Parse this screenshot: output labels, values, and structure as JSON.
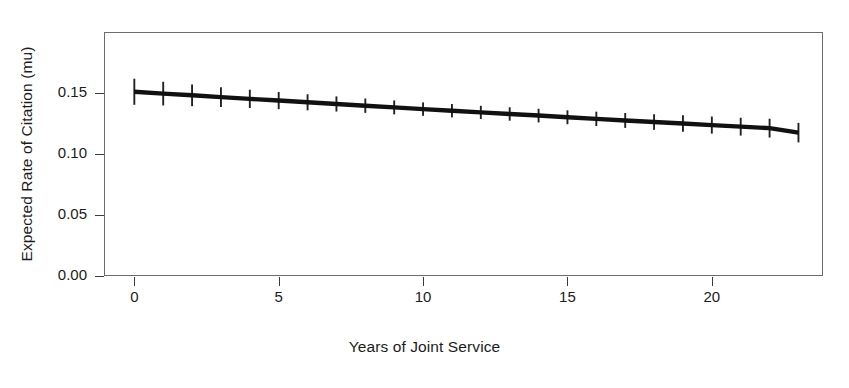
{
  "chart_data": {
    "type": "line",
    "title": "",
    "xlabel": "Years of Joint Service",
    "ylabel": "Expected Rate of Citation (mu)",
    "xlim": [
      -1.05,
      23.85
    ],
    "ylim": [
      0.0,
      0.2
    ],
    "grid": false,
    "legend": "none",
    "xticks": [
      0,
      5,
      10,
      15,
      20
    ],
    "xtick_labels": [
      "0",
      "5",
      "10",
      "15",
      "20"
    ],
    "yticks": [
      0.0,
      0.05,
      0.1,
      0.15
    ],
    "ytick_labels": [
      "0.00",
      "0.05",
      "0.10",
      "0.15"
    ],
    "line_color": "#111111",
    "errorbar_color": "#222222",
    "axis_color": "#6b6b6b",
    "x": [
      0,
      1,
      2,
      3,
      4,
      5,
      6,
      7,
      8,
      9,
      10,
      11,
      12,
      13,
      14,
      15,
      16,
      17,
      18,
      19,
      20,
      21,
      22,
      23
    ],
    "values": [
      0.151,
      0.1495,
      0.1481,
      0.1466,
      0.1452,
      0.1438,
      0.1424,
      0.141,
      0.1396,
      0.1382,
      0.1368,
      0.1355,
      0.1341,
      0.1328,
      0.1315,
      0.1301,
      0.1288,
      0.1275,
      0.1262,
      0.125,
      0.1237,
      0.1224,
      0.1212,
      0.1175
    ],
    "error_low": [
      0.1403,
      0.1398,
      0.1392,
      0.1385,
      0.1377,
      0.1368,
      0.1358,
      0.1348,
      0.1337,
      0.1325,
      0.1313,
      0.13,
      0.1287,
      0.1273,
      0.1259,
      0.1244,
      0.1229,
      0.1214,
      0.1198,
      0.1183,
      0.1167,
      0.1151,
      0.1135,
      0.1095
    ],
    "error_high": [
      0.1617,
      0.1592,
      0.157,
      0.1547,
      0.1527,
      0.1508,
      0.149,
      0.1472,
      0.1455,
      0.1439,
      0.1423,
      0.141,
      0.1395,
      0.1383,
      0.1371,
      0.1358,
      0.1347,
      0.1336,
      0.1326,
      0.1317,
      0.1307,
      0.1297,
      0.1289,
      0.1255
    ],
    "series_name": "Expected rate of citation"
  }
}
